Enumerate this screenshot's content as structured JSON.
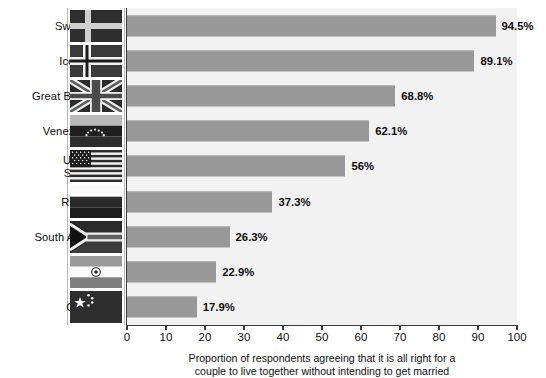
{
  "chart_data": {
    "type": "bar",
    "orientation": "horizontal",
    "title": "",
    "xlabel": "Proportion of respondents agreeing that it is all right for a couple to live together without intending to get married",
    "ylabel": "",
    "xlim": [
      0,
      100
    ],
    "xticks": [
      "0",
      "10",
      "20",
      "30",
      "40",
      "50",
      "60",
      "70",
      "80",
      "90",
      "100"
    ],
    "xtick_values": [
      0,
      10,
      20,
      30,
      40,
      50,
      60,
      70,
      80,
      90,
      100
    ],
    "grid": false,
    "legend": "none",
    "categories": [
      "Sweden",
      "Iceland",
      "Great Britain",
      "Venezuela",
      "United States",
      "Russia",
      "South Africa",
      "India",
      "China"
    ],
    "values": [
      94.5,
      89.1,
      68.8,
      62.1,
      56,
      37.3,
      26.3,
      22.9,
      17.9
    ],
    "value_labels": [
      "94.5%",
      "89.1%",
      "68.8%",
      "62.1%",
      "56%",
      "37.3%",
      "26.3%",
      "22.9%",
      "17.9%"
    ],
    "bar_color": "#989898",
    "plot_background": "#f2f2f2",
    "axis_color": "#3a3a3a"
  },
  "caption": {
    "line1": "Proportion of respondents agreeing that it is all right for a",
    "line2": "couple to live together without intending to get married"
  },
  "rows": [
    {
      "label_line1": "Sweden",
      "label_line2": "",
      "value": 94.5,
      "value_label": "94.5%",
      "flag": "sweden-flag"
    },
    {
      "label_line1": "Iceland",
      "label_line2": "",
      "value": 89.1,
      "value_label": "89.1%",
      "flag": "iceland-flag"
    },
    {
      "label_line1": "Great Britain",
      "label_line2": "",
      "value": 68.8,
      "value_label": "68.8%",
      "flag": "great-britain-flag"
    },
    {
      "label_line1": "Venezuela",
      "label_line2": "",
      "value": 62.1,
      "value_label": "62.1%",
      "flag": "venezuela-flag"
    },
    {
      "label_line1": "United",
      "label_line2": "States",
      "value": 56,
      "value_label": "56%",
      "flag": "united-states-flag"
    },
    {
      "label_line1": "Russia",
      "label_line2": "",
      "value": 37.3,
      "value_label": "37.3%",
      "flag": "russia-flag"
    },
    {
      "label_line1": "South Africa",
      "label_line2": "",
      "value": 26.3,
      "value_label": "26.3%",
      "flag": "south-africa-flag"
    },
    {
      "label_line1": "India",
      "label_line2": "",
      "value": 22.9,
      "value_label": "22.9%",
      "flag": "india-flag"
    },
    {
      "label_line1": "China",
      "label_line2": "",
      "value": 17.9,
      "value_label": "17.9%",
      "flag": "china-flag"
    }
  ]
}
